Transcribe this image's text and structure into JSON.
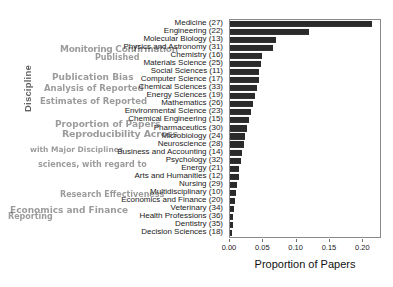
{
  "chart_data": {
    "type": "bar",
    "orientation": "horizontal",
    "title": "",
    "xlabel": "Proportion of Papers",
    "ylabel": "Discipline",
    "xlim": [
      0.0,
      0.225
    ],
    "xticks": [
      0.0,
      0.05,
      0.1,
      0.15,
      0.2
    ],
    "xticklabels": [
      "0.00",
      "0.05",
      "0.10",
      "0.15",
      "0.20"
    ],
    "grid": false,
    "legend": null,
    "bar_color": "#2a2a2a",
    "categories": [
      "Medicine (27)",
      "Engineering (22)",
      "Molecular Biology (13)",
      "Physics and Astronomy (31)",
      "Chemistry (16)",
      "Materials Science (25)",
      "Social Sciences (11)",
      "Computer Science (17)",
      "Chemical Sciences (33)",
      "Energy Sciences (19)",
      "Mathematics (26)",
      "Environmental Science (23)",
      "Chemical Engineering (15)",
      "Pharmaceutics (30)",
      "Microbiology (24)",
      "Neuroscience (28)",
      "Business and Accounting (14)",
      "Psychology (32)",
      "Energy (21)",
      "Arts and Humanities (12)",
      "Nursing (29)",
      "Multidisciplinary (10)",
      "Economics and Finance (20)",
      "Veterinary (34)",
      "Health Professions (36)",
      "Dentistry (35)",
      "Decision Sciences (18)"
    ],
    "values": [
      0.213,
      0.118,
      0.069,
      0.065,
      0.048,
      0.046,
      0.044,
      0.043,
      0.041,
      0.038,
      0.035,
      0.031,
      0.029,
      0.026,
      0.023,
      0.021,
      0.018,
      0.016,
      0.014,
      0.013,
      0.011,
      0.009,
      0.008,
      0.006,
      0.005,
      0.004,
      0.003
    ]
  },
  "artifacts": {
    "ghost_texts": [
      "Monitoring Confirmation",
      "Published",
      "Publication Bias",
      "Analysis of Reported",
      "Estimates of Reported",
      "Proportion of Papers",
      "Reproducibility Across",
      "with Major Disciplines",
      "sciences, with regard to",
      "Discipline",
      "Research Effectiveness",
      "Economics and Finance",
      "Reporting"
    ]
  }
}
